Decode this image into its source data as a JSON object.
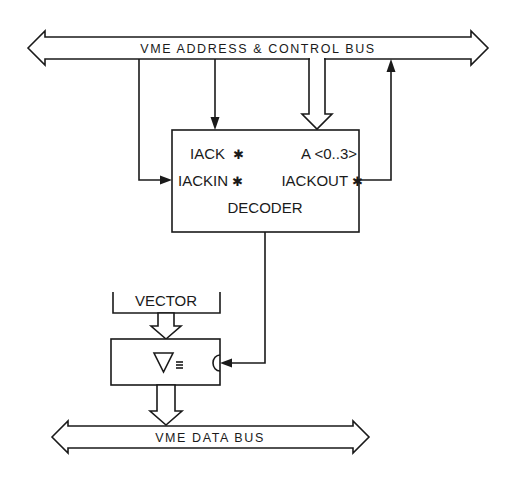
{
  "diagram": {
    "address_bus": {
      "label": "VME ADDRESS & CONTROL BUS"
    },
    "data_bus": {
      "label": "VME DATA BUS"
    },
    "decoder": {
      "pins": {
        "iack": "IACK",
        "address": "A <0..3>",
        "iackin": "IACKIN",
        "iackout": "IACKOUT"
      },
      "label": "DECODER",
      "active_low_marker": "✱"
    },
    "vector": {
      "label": "VECTOR"
    },
    "buffer": {
      "symbol": "▽",
      "tristate_marker": "≡"
    },
    "connections": [
      {
        "from": "address_bus",
        "to": "decoder.iackin",
        "type": "line-arrow"
      },
      {
        "from": "address_bus",
        "to": "decoder.iack",
        "type": "line-arrow"
      },
      {
        "from": "address_bus",
        "to": "decoder.address",
        "type": "wide-arrow"
      },
      {
        "from": "decoder.iackout",
        "to": "address_bus",
        "type": "line-arrow"
      },
      {
        "from": "decoder",
        "to": "buffer.enable",
        "type": "line-arrow"
      },
      {
        "from": "vector",
        "to": "buffer",
        "type": "wide-arrow"
      },
      {
        "from": "buffer",
        "to": "data_bus",
        "type": "wide-arrow"
      }
    ]
  }
}
